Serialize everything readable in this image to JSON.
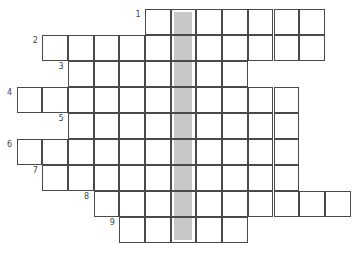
{
  "puzzle": {
    "type": "crossword",
    "cell_size": 25.7,
    "origin_x": 17,
    "origin_y": 9,
    "highlight_column": 6,
    "highlight_color": "#c8c8c8",
    "rows": [
      {
        "clue": "1",
        "start_col": 5,
        "end_col": 11
      },
      {
        "clue": "2",
        "start_col": 1,
        "end_col": 11
      },
      {
        "clue": "3",
        "start_col": 2,
        "end_col": 8
      },
      {
        "clue": "4",
        "start_col": 0,
        "end_col": 10
      },
      {
        "clue": "5",
        "start_col": 2,
        "end_col": 10
      },
      {
        "clue": "6",
        "start_col": 0,
        "end_col": 10
      },
      {
        "clue": "7",
        "start_col": 1,
        "end_col": 10
      },
      {
        "clue": "8",
        "start_col": 3,
        "end_col": 12
      },
      {
        "clue": "9",
        "start_col": 4,
        "end_col": 8
      }
    ]
  }
}
